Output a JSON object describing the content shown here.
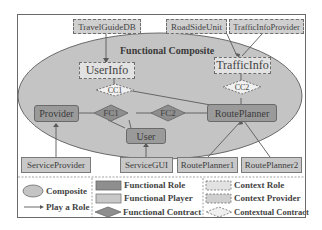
{
  "diagram": {
    "composite_label": "Functional Composite",
    "context_providers": [
      {
        "id": "travel",
        "label": "TravelGuideDB"
      },
      {
        "id": "roadside",
        "label": "RoadSideUnit"
      },
      {
        "id": "trafficprov",
        "label": "TrafficInfoProvider"
      }
    ],
    "context_roles": [
      {
        "id": "userinfo",
        "label": "UserInfo"
      },
      {
        "id": "trafficinfo",
        "label": "TrafficInfo"
      }
    ],
    "contextual_contracts": [
      {
        "id": "cc1",
        "label": "CC1"
      },
      {
        "id": "cc2",
        "label": "CC2"
      }
    ],
    "functional_roles": [
      {
        "id": "provider",
        "label": "Provider"
      },
      {
        "id": "user",
        "label": "User"
      },
      {
        "id": "routeplanner",
        "label": "RoutePlanner"
      }
    ],
    "functional_contracts": [
      {
        "id": "fc1",
        "label": "FC1"
      },
      {
        "id": "fc2",
        "label": "FC2"
      }
    ],
    "functional_players": [
      {
        "id": "serviceprovider",
        "label": "ServiceProvider"
      },
      {
        "id": "servicegui",
        "label": "ServiceGUI"
      },
      {
        "id": "rp1",
        "label": "RoutePlanner1"
      },
      {
        "id": "rp2",
        "label": "RoutePlanner2"
      }
    ]
  },
  "legend": {
    "composite": "Composite",
    "play_role": "Play a Role",
    "functional_role": "Functional Role",
    "functional_player": "Functional Player",
    "functional_contract": "Functional Contract",
    "context_role": "Context Role",
    "context_provider": "Context Provider",
    "contextual_contract": "Contextual Contract"
  },
  "colors": {
    "composite_fill": "#c4c4c4",
    "functional_role": "#9a9a9a",
    "functional_player": "#c8c8c8",
    "context_provider": "#cfcfcf",
    "context_role": "#e2e2e2",
    "line": "#5a5a5a"
  }
}
